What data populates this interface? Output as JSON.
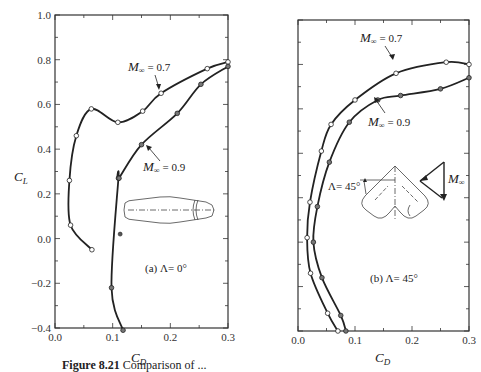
{
  "figure": {
    "caption_prefix": "Figure 8.21",
    "caption_text": "Comparison of ..."
  },
  "chart_data": [
    {
      "type": "line",
      "title": "(a) Λ = 0°",
      "panel_label": "(a) Λ= 0°",
      "xlabel": "C_D",
      "ylabel": "C_L",
      "xlim": [
        0.0,
        0.3
      ],
      "ylim": [
        -0.4,
        1.0
      ],
      "xticks": [
        "0.0",
        "0.1",
        "0.2",
        "0.3"
      ],
      "yticks": [
        "1.0",
        "0.8",
        "0.6",
        "0.4",
        "0.2",
        "0.0",
        "−0.2",
        "−0.4"
      ],
      "grid": false,
      "series": [
        {
          "name": "M∞ = 0.7",
          "marker": "open-circle",
          "points": [
            [
              0.064,
              -0.05
            ],
            [
              0.027,
              0.06
            ],
            [
              0.025,
              0.26
            ],
            [
              0.037,
              0.46
            ],
            [
              0.063,
              0.58
            ],
            [
              0.109,
              0.52
            ],
            [
              0.152,
              0.57
            ],
            [
              0.184,
              0.65
            ],
            [
              0.264,
              0.76
            ],
            [
              0.3,
              0.79
            ]
          ]
        },
        {
          "name": "M∞ = 0.9",
          "marker": "filled-circle",
          "points": [
            [
              0.118,
              -0.41
            ],
            [
              0.098,
              -0.22
            ],
            [
              0.11,
              0.27
            ],
            [
              0.111,
              0.27
            ],
            [
              0.15,
              0.42
            ],
            [
              0.212,
              0.56
            ],
            [
              0.253,
              0.69
            ],
            [
              0.3,
              0.77
            ]
          ]
        }
      ],
      "annotations": [
        {
          "text": "M∞ = 0.7",
          "at": [
            0.184,
            0.65
          ]
        },
        {
          "text": "M∞ = 0.9",
          "at": [
            0.15,
            0.42
          ]
        },
        {
          "text": "isolated point",
          "at": [
            0.113,
            0.02
          ]
        }
      ]
    },
    {
      "type": "line",
      "title": "(b) Λ = 45°",
      "panel_label": "(b) Λ= 45°",
      "xlabel": "C_D",
      "ylabel": "",
      "xlim": [
        0.0,
        0.3
      ],
      "ylim": [
        -0.4,
        1.0
      ],
      "xticks": [
        "0.0",
        "0.1",
        "0.2",
        "0.3"
      ],
      "yticks": [],
      "grid": false,
      "series": [
        {
          "name": "M∞ = 0.7",
          "marker": "open-circle",
          "points": [
            [
              0.07,
              -0.4
            ],
            [
              0.052,
              -0.32
            ],
            [
              0.022,
              -0.14
            ],
            [
              0.016,
              0.02
            ],
            [
              0.021,
              0.18
            ],
            [
              0.041,
              0.41
            ],
            [
              0.058,
              0.53
            ],
            [
              0.1,
              0.64
            ],
            [
              0.172,
              0.76
            ],
            [
              0.26,
              0.81
            ],
            [
              0.3,
              0.8
            ]
          ]
        },
        {
          "name": "M∞ = 0.9",
          "marker": "filled-circle",
          "points": [
            [
              0.084,
              -0.4
            ],
            [
              0.075,
              -0.33
            ],
            [
              0.042,
              -0.16
            ],
            [
              0.027,
              0.0
            ],
            [
              0.034,
              0.16
            ],
            [
              0.055,
              0.36
            ],
            [
              0.09,
              0.54
            ],
            [
              0.14,
              0.64
            ],
            [
              0.18,
              0.66
            ],
            [
              0.25,
              0.69
            ],
            [
              0.3,
              0.74
            ]
          ]
        }
      ],
      "annotations": [
        {
          "text": "M∞ = 0.7",
          "at": [
            0.172,
            0.76
          ]
        },
        {
          "text": "M∞ = 0.9",
          "at": [
            0.14,
            0.64
          ]
        },
        {
          "text": "Λ= 45°",
          "at": [
            0.04,
            0.2
          ]
        },
        {
          "text": "M∞",
          "at": [
            0.27,
            0.2
          ]
        }
      ]
    }
  ],
  "labels": {
    "cl": "C",
    "cl_sub": "L",
    "cd": "C",
    "cd_sub": "D",
    "m07": "= 0.7",
    "m09": "= 0.9",
    "m_sym": "M",
    "m_sub": "∞",
    "panel_a": "(a) Λ= 0°",
    "panel_b": "(b) Λ= 45°",
    "sweep": "Λ= 45°"
  }
}
